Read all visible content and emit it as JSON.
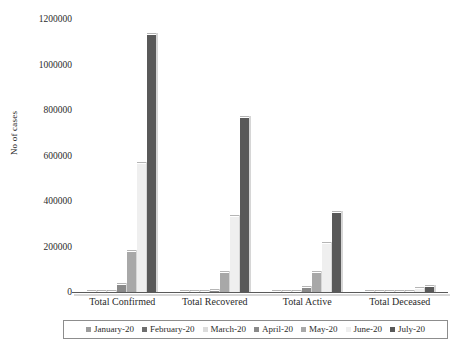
{
  "chart_data": {
    "type": "bar",
    "title": "",
    "subtitle": "",
    "xlabel": "",
    "ylabel": "No of cases",
    "ylim": [
      0,
      1200000
    ],
    "ytick_labels": [
      "0",
      "200000",
      "400000",
      "600000",
      "800000",
      "1000000",
      "1200000"
    ],
    "ytick_values": [
      0,
      200000,
      400000,
      600000,
      800000,
      1000000,
      1200000
    ],
    "grid": false,
    "legend_position": "bottom",
    "categories": [
      "Total Confirmed",
      "Total Recovered",
      "Total Active",
      "Total Deceased"
    ],
    "series": [
      {
        "name": "January-20",
        "color": "#9c9c9c",
        "values": [
          1,
          0,
          1,
          0
        ]
      },
      {
        "name": "February-20",
        "color": "#6e6e6e",
        "values": [
          3,
          3,
          0,
          0
        ]
      },
      {
        "name": "March-20",
        "color": "#dcdcdc",
        "values": [
          1397,
          124,
          1238,
          35
        ]
      },
      {
        "name": "April-20",
        "color": "#8a8a8a",
        "values": [
          33062,
          8437,
          23448,
          1079
        ]
      },
      {
        "name": "May-20",
        "color": "#a8a8a8",
        "values": [
          182143,
          86984,
          89995,
          5164
        ]
      },
      {
        "name": "June-20",
        "color": "#efefef",
        "values": [
          566840,
          334822,
          215125,
          16893
        ]
      },
      {
        "name": "July-20",
        "color": "#595959",
        "values": [
          1135000,
          769000,
          352000,
          27000
        ]
      }
    ]
  },
  "legend": {
    "items": [
      {
        "label": "January-20",
        "color": "#9c9c9c"
      },
      {
        "label": "February-20",
        "color": "#6e6e6e"
      },
      {
        "label": "March-20",
        "color": "#dcdcdc"
      },
      {
        "label": "April-20",
        "color": "#8a8a8a"
      },
      {
        "label": "May-20",
        "color": "#a8a8a8"
      },
      {
        "label": "June-20",
        "color": "#efefef"
      },
      {
        "label": "July-20",
        "color": "#595959"
      }
    ]
  }
}
